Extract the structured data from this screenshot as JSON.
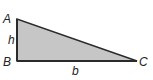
{
  "diagram": {
    "type": "right-triangle",
    "vertices": {
      "A": {
        "label": "A"
      },
      "B": {
        "label": "B"
      },
      "C": {
        "label": "C"
      }
    },
    "sides": {
      "height": {
        "label": "h"
      },
      "base": {
        "label": "b"
      }
    },
    "colors": {
      "fill": "#c6c6c6",
      "stroke": "#2a2a2a"
    }
  }
}
